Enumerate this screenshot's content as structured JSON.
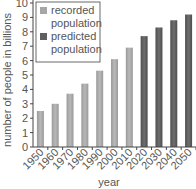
{
  "chart_data": {
    "type": "bar",
    "title": "",
    "xlabel": "year",
    "ylabel": "number of people in billions",
    "ylim": [
      0,
      10
    ],
    "yticks": [
      "0",
      "1",
      "2",
      "3",
      "4",
      "5",
      "6",
      "7",
      "8",
      "9",
      "10"
    ],
    "categories": [
      "1950",
      "1960",
      "1970",
      "1980",
      "1990",
      "2000",
      "2010",
      "2020",
      "2030",
      "2040",
      "2050"
    ],
    "values": [
      2.5,
      3.0,
      3.7,
      4.4,
      5.3,
      6.1,
      6.9,
      7.7,
      8.3,
      8.8,
      9.2
    ],
    "series_type": [
      "recorded",
      "recorded",
      "recorded",
      "recorded",
      "recorded",
      "recorded",
      "recorded",
      "predicted",
      "predicted",
      "predicted",
      "predicted"
    ],
    "legend": [
      {
        "key": "recorded",
        "line1": "recorded",
        "line2": "population",
        "color": "#a6a6a6"
      },
      {
        "key": "predicted",
        "line1": "predicted",
        "line2": "population",
        "color": "#5f5f5f"
      }
    ],
    "legend_position": "top-left",
    "grid": false
  }
}
